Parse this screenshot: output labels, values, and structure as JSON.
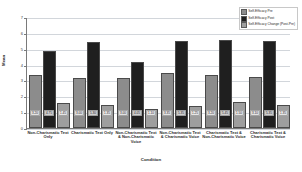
{
  "chart_data": {
    "type": "bar",
    "title": "",
    "xlabel": "Condition",
    "ylabel": "Mean",
    "ylim": [
      0,
      7
    ],
    "yticks": [
      0,
      1,
      2,
      3,
      4,
      5,
      6,
      7
    ],
    "grid": true,
    "legend_position": "top-right",
    "categories": [
      "Non-Charismatic Text Only",
      "Charismatic Text Only",
      "Non-Charismatic Text & Non-Charismatic Voice",
      "Non-Charismatic Text & Charismatic Voice",
      "Charismatic Text & Non-Charismatic Voice",
      "Charismatic Text & Charismatic Voice"
    ],
    "series": [
      {
        "name": "Self-Efficacy Pre",
        "color": "#8c8c8c",
        "values": [
          3.2,
          3.0,
          3.0,
          3.35,
          3.2,
          3.1
        ],
        "labels": [
          "3.20",
          "3.00",
          "3.00",
          "3.35",
          "3.20",
          "3.10"
        ]
      },
      {
        "name": "Self-Efficacy Post",
        "color": "#1f1f1f",
        "values": [
          4.75,
          5.3,
          4.05,
          5.35,
          5.45,
          5.35
        ],
        "labels": [
          "4.75",
          "5.30",
          "4.05",
          "5.35",
          "5.45",
          "5.35"
        ]
      },
      {
        "name": "Self-Efficacy Change (Post-Pre)",
        "color": "#9e9e9e",
        "values": [
          1.45,
          1.35,
          1.1,
          1.25,
          1.5,
          1.35
        ],
        "labels": [
          "1.45",
          "1.35",
          "1.10",
          "1.25",
          "1.50",
          "1.35"
        ]
      }
    ]
  }
}
